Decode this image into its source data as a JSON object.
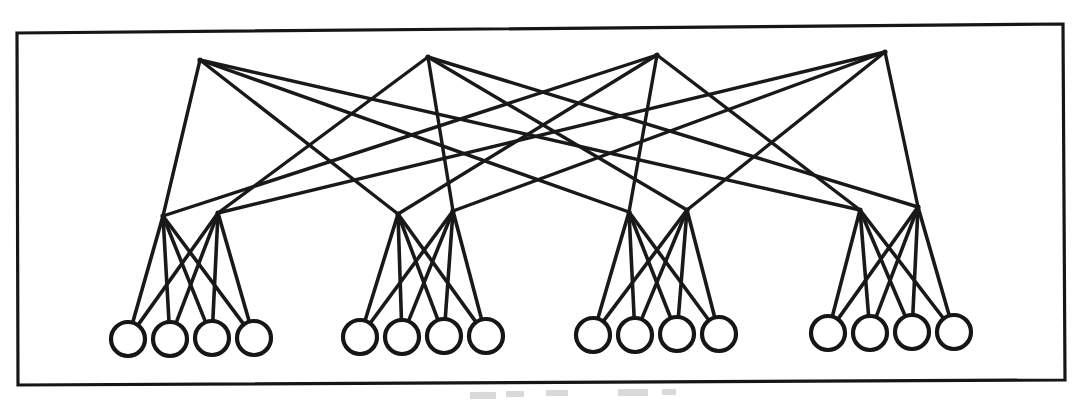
{
  "figure": {
    "kind": "node-link-diagram",
    "background_color": "#ffffff",
    "ink_color": "#191919",
    "frame": {
      "x": 17,
      "y": 28,
      "width": 1046,
      "height": 355,
      "stroke_width": 3.2
    },
    "tilt_note": "scanned page, frame slightly rotated"
  },
  "graph_data": {
    "type": "layered-graph",
    "layers": [
      {
        "name": "top-tier",
        "count": 4,
        "marker": "vertex-point"
      },
      {
        "name": "middle-tier",
        "count": 8,
        "marker": "vertex-point"
      },
      {
        "name": "leaf-tier",
        "count": 16,
        "marker": "circle"
      }
    ],
    "leaf_radius": 17,
    "top_nodes": [
      {
        "id": "t0",
        "x": 200,
        "y": 60
      },
      {
        "id": "t1",
        "x": 428,
        "y": 57
      },
      {
        "id": "t2",
        "x": 657,
        "y": 55
      },
      {
        "id": "t3",
        "x": 885,
        "y": 52
      }
    ],
    "mid_nodes": [
      {
        "id": "m0",
        "x": 163,
        "y": 216,
        "group": 0
      },
      {
        "id": "m1",
        "x": 218,
        "y": 213,
        "group": 0
      },
      {
        "id": "m2",
        "x": 398,
        "y": 214,
        "group": 1
      },
      {
        "id": "m3",
        "x": 453,
        "y": 211,
        "group": 1
      },
      {
        "id": "m4",
        "x": 629,
        "y": 212,
        "group": 2
      },
      {
        "id": "m5",
        "x": 687,
        "y": 210,
        "group": 2
      },
      {
        "id": "m6",
        "x": 860,
        "y": 210,
        "group": 3
      },
      {
        "id": "m7",
        "x": 918,
        "y": 207,
        "group": 3
      }
    ],
    "leaf_nodes": [
      {
        "id": "l0",
        "x": 128,
        "y": 339,
        "group": 0
      },
      {
        "id": "l1",
        "x": 170,
        "y": 339,
        "group": 0
      },
      {
        "id": "l2",
        "x": 212,
        "y": 338,
        "group": 0
      },
      {
        "id": "l3",
        "x": 254,
        "y": 338,
        "group": 0
      },
      {
        "id": "l4",
        "x": 360,
        "y": 337,
        "group": 1
      },
      {
        "id": "l5",
        "x": 402,
        "y": 337,
        "group": 1
      },
      {
        "id": "l6",
        "x": 444,
        "y": 336,
        "group": 1
      },
      {
        "id": "l7",
        "x": 486,
        "y": 336,
        "group": 1
      },
      {
        "id": "l8",
        "x": 593,
        "y": 335,
        "group": 2
      },
      {
        "id": "l9",
        "x": 635,
        "y": 335,
        "group": 2
      },
      {
        "id": "l10",
        "x": 677,
        "y": 334,
        "group": 2
      },
      {
        "id": "l11",
        "x": 719,
        "y": 334,
        "group": 2
      },
      {
        "id": "l12",
        "x": 828,
        "y": 333,
        "group": 3
      },
      {
        "id": "l13",
        "x": 870,
        "y": 333,
        "group": 3
      },
      {
        "id": "l14",
        "x": 912,
        "y": 332,
        "group": 3
      },
      {
        "id": "l15",
        "x": 954,
        "y": 332,
        "group": 3
      }
    ],
    "top_to_mid_edges": [
      [
        "t0",
        "m0"
      ],
      [
        "t0",
        "m2"
      ],
      [
        "t0",
        "m4"
      ],
      [
        "t0",
        "m6"
      ],
      [
        "t1",
        "m1"
      ],
      [
        "t1",
        "m3"
      ],
      [
        "t1",
        "m5"
      ],
      [
        "t1",
        "m7"
      ],
      [
        "t2",
        "m0"
      ],
      [
        "t2",
        "m2"
      ],
      [
        "t2",
        "m4"
      ],
      [
        "t2",
        "m6"
      ],
      [
        "t3",
        "m1"
      ],
      [
        "t3",
        "m3"
      ],
      [
        "t3",
        "m5"
      ],
      [
        "t3",
        "m7"
      ]
    ],
    "mid_to_leaf_edges": [
      [
        "m0",
        "l0"
      ],
      [
        "m0",
        "l1"
      ],
      [
        "m0",
        "l2"
      ],
      [
        "m0",
        "l3"
      ],
      [
        "m1",
        "l0"
      ],
      [
        "m1",
        "l1"
      ],
      [
        "m1",
        "l2"
      ],
      [
        "m1",
        "l3"
      ],
      [
        "m2",
        "l4"
      ],
      [
        "m2",
        "l5"
      ],
      [
        "m2",
        "l6"
      ],
      [
        "m2",
        "l7"
      ],
      [
        "m3",
        "l4"
      ],
      [
        "m3",
        "l5"
      ],
      [
        "m3",
        "l6"
      ],
      [
        "m3",
        "l7"
      ],
      [
        "m4",
        "l8"
      ],
      [
        "m4",
        "l9"
      ],
      [
        "m4",
        "l10"
      ],
      [
        "m4",
        "l11"
      ],
      [
        "m5",
        "l8"
      ],
      [
        "m5",
        "l9"
      ],
      [
        "m5",
        "l10"
      ],
      [
        "m5",
        "l11"
      ],
      [
        "m6",
        "l12"
      ],
      [
        "m6",
        "l13"
      ],
      [
        "m6",
        "l14"
      ],
      [
        "m6",
        "l15"
      ],
      [
        "m7",
        "l12"
      ],
      [
        "m7",
        "l13"
      ],
      [
        "m7",
        "l14"
      ],
      [
        "m7",
        "l15"
      ]
    ],
    "scan_artifacts": [
      {
        "x": 470,
        "y": 392,
        "width": 26,
        "height": 7
      },
      {
        "x": 506,
        "y": 391,
        "width": 18,
        "height": 6
      },
      {
        "x": 546,
        "y": 390,
        "width": 22,
        "height": 6
      },
      {
        "x": 618,
        "y": 389,
        "width": 30,
        "height": 7
      },
      {
        "x": 662,
        "y": 389,
        "width": 14,
        "height": 6
      }
    ]
  }
}
